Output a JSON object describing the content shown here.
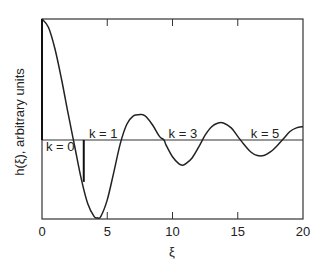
{
  "chart_data": {
    "type": "line",
    "title": "",
    "xlabel": "ξ",
    "ylabel": "h(ξ), arbitrary units",
    "xlim": [
      0,
      20
    ],
    "ylim": [
      -0.66,
      1.0
    ],
    "x_ticks": [
      0,
      5,
      10,
      15,
      20
    ],
    "x_tick_labels": [
      "0",
      "5",
      "10",
      "15",
      "20"
    ],
    "y_ticks": [],
    "grid": false,
    "legend": null,
    "zero_line": true,
    "annotations": [
      {
        "text": "k = 0",
        "x": 0.3,
        "y": -0.06
      },
      {
        "text": "k = 1",
        "x": 3.6,
        "y": 0.05
      },
      {
        "text": "k = 3",
        "x": 9.7,
        "y": 0.05
      },
      {
        "text": "k = 5",
        "x": 16.0,
        "y": 0.05
      }
    ],
    "markers": [
      {
        "type": "vertical-segment",
        "x": 0,
        "y_from": 0,
        "y_to": 1.0,
        "note": "k = 0 spike"
      },
      {
        "type": "vertical-segment",
        "x": 3.2,
        "y_from": 0,
        "y_to": -0.35,
        "note": "k = 1 bar"
      }
    ],
    "series": [
      {
        "name": "h(ξ)",
        "x": [
          0,
          0.5,
          1,
          1.5,
          2,
          2.5,
          3,
          3.5,
          4,
          4.25,
          4.5,
          5,
          5.5,
          6,
          6.5,
          7,
          7.5,
          7.7,
          8,
          8.5,
          9,
          9.35,
          9.5,
          10,
          10.5,
          10.8,
          11,
          11.5,
          12,
          12.5,
          13,
          13.5,
          13.9,
          14.5,
          15,
          15.5,
          16,
          16.5,
          17,
          17.5,
          18,
          18.5,
          19,
          19.5,
          20
        ],
        "values": [
          1.0,
          0.93,
          0.75,
          0.5,
          0.22,
          -0.05,
          -0.32,
          -0.53,
          -0.64,
          -0.65,
          -0.64,
          -0.5,
          -0.27,
          -0.03,
          0.13,
          0.2,
          0.21,
          0.21,
          0.19,
          0.12,
          0.03,
          0.0,
          -0.04,
          -0.14,
          -0.2,
          -0.21,
          -0.2,
          -0.15,
          -0.06,
          0.04,
          0.11,
          0.14,
          0.14,
          0.1,
          0.03,
          -0.04,
          -0.1,
          -0.13,
          -0.13,
          -0.1,
          -0.05,
          0.01,
          0.07,
          0.1,
          0.11
        ]
      }
    ]
  }
}
